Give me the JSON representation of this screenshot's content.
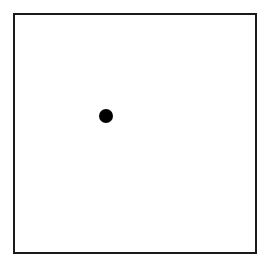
{
  "diagram": {
    "frame": {
      "border_color": "#1a1a1a",
      "background": "#ffffff"
    },
    "points": [
      {
        "label": "",
        "cx": 106,
        "cy": 116,
        "radius": 7,
        "color": "#000000"
      }
    ]
  }
}
